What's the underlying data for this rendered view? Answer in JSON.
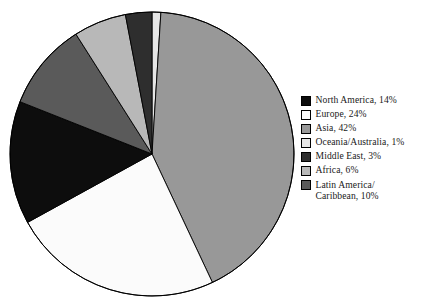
{
  "chart_data": {
    "type": "pie",
    "title": "",
    "subtitle": "",
    "xlabel": "",
    "ylabel": "",
    "legend_position": "right",
    "grid": false,
    "units": "percent",
    "start_angle_deg": 0,
    "direction": "clockwise",
    "categories": [
      "North America",
      "Europe",
      "Asia",
      "Oceania/Australia",
      "Middle East",
      "Africa",
      "Latin America/Caribbean"
    ],
    "values": [
      14,
      24,
      42,
      1,
      3,
      6,
      10
    ],
    "slice_colors": [
      "#0d0d0d",
      "#fbfbfb",
      "#989898",
      "#e6e6e6",
      "#2e2e2e",
      "#b8b8b8",
      "#5a5a5a"
    ],
    "draw_order": [
      "Oceania/Australia",
      "Asia",
      "Europe",
      "North America",
      "Latin America/Caribbean",
      "Africa",
      "Middle East"
    ],
    "slices": [
      {
        "label": "Oceania/Australia",
        "value": 1,
        "color": "#e6e6e6",
        "start_deg": 0,
        "end_deg": 3.6
      },
      {
        "label": "Asia",
        "value": 42,
        "color": "#989898",
        "start_deg": 3.6,
        "end_deg": 154.8
      },
      {
        "label": "Europe",
        "value": 24,
        "color": "#fbfbfb",
        "start_deg": 154.8,
        "end_deg": 241.2
      },
      {
        "label": "North America",
        "value": 14,
        "color": "#0d0d0d",
        "start_deg": 241.2,
        "end_deg": 291.6
      },
      {
        "label": "Latin America/Caribbean",
        "value": 10,
        "color": "#5a5a5a",
        "start_deg": 291.6,
        "end_deg": 327.6
      },
      {
        "label": "Africa",
        "value": 6,
        "color": "#b8b8b8",
        "start_deg": 327.6,
        "end_deg": 349.2
      },
      {
        "label": "Middle East",
        "value": 3,
        "color": "#2e2e2e",
        "start_deg": 349.2,
        "end_deg": 360
      }
    ]
  },
  "legend": {
    "entries": [
      {
        "text": "North America, 14%",
        "color": "#0d0d0d",
        "name": "north-america"
      },
      {
        "text": "Europe, 24%",
        "color": "#fbfbfb",
        "name": "europe"
      },
      {
        "text": "Asia, 42%",
        "color": "#989898",
        "name": "asia"
      },
      {
        "text": "Oceania/Australia, 1%",
        "color": "#e6e6e6",
        "name": "oceania-australia"
      },
      {
        "text": "Middle East, 3%",
        "color": "#2e2e2e",
        "name": "middle-east"
      },
      {
        "text": "Africa, 6%",
        "color": "#b8b8b8",
        "name": "africa"
      },
      {
        "text": "Latin America/\nCaribbean, 10%",
        "color": "#5a5a5a",
        "name": "latin-america-caribbean"
      }
    ]
  },
  "style": {
    "pie_outline": "#000000",
    "background": "#ffffff"
  }
}
